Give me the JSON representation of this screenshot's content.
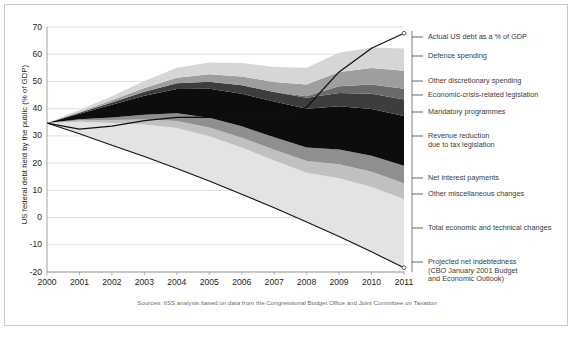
{
  "figure": {
    "source_note": "Sources: IISS analysis based on data from the Congressional Budget Office and Joint Committee on Taxation"
  },
  "chart_data": {
    "type": "area",
    "title": "",
    "xlabel": "",
    "ylabel": "US federal debt held by the public (% of GDP)",
    "xlim": [
      2000,
      2011
    ],
    "ylim": [
      -20,
      70
    ],
    "ytick_labels": [
      "70",
      "60",
      "50",
      "40",
      "30",
      "20",
      "10",
      "0",
      "-10",
      "-20"
    ],
    "ytick_values": [
      70,
      60,
      50,
      40,
      30,
      20,
      10,
      0,
      -10,
      -20
    ],
    "xtick_labels": [
      "2000",
      "2001",
      "2002",
      "2003",
      "2004",
      "2005",
      "2006",
      "2007",
      "2008",
      "2009",
      "2010",
      "2011"
    ],
    "x": [
      2000,
      2001,
      2002,
      2003,
      2004,
      2005,
      2006,
      2007,
      2008,
      2009,
      2010,
      2011
    ],
    "grid": "horizontal",
    "legend_position": "right-outside",
    "baseline_series": {
      "name": "Projected net indebtedness (CBO January 2001 Budget and Economic Outlook)",
      "values": [
        34.7,
        30.8,
        26.6,
        22.4,
        18.0,
        13.4,
        8.6,
        3.6,
        -1.6,
        -7.0,
        -12.6,
        -18.4
      ],
      "color": "#111111"
    },
    "total_line": {
      "name": "Actual US debt as a % of GDP",
      "values": [
        34.7,
        32.5,
        33.6,
        35.6,
        36.8,
        36.9,
        36.5,
        36.2,
        40.5,
        53.5,
        62.2,
        67.7
      ],
      "color": "#111111"
    },
    "series": [
      {
        "name": "Total economic and technical changes",
        "values": [
          0.0,
          4.4,
          8.1,
          11.8,
          14.9,
          16.5,
          17.1,
          17.4,
          18.1,
          21.4,
          23.8,
          25.2
        ],
        "color": "#e3e3e3"
      },
      {
        "name": "Other miscellaneous changes",
        "values": [
          0.0,
          0.5,
          1.1,
          1.8,
          2.6,
          3.2,
          3.6,
          3.9,
          4.3,
          5.2,
          5.6,
          5.8
        ],
        "color": "#c0c0c0"
      },
      {
        "name": "Net interest payments",
        "values": [
          0.0,
          0.4,
          1.0,
          1.8,
          2.8,
          3.6,
          4.2,
          4.6,
          4.9,
          5.4,
          5.9,
          6.4
        ],
        "color": "#8f8f8f"
      },
      {
        "name": "Revenue reduction due to tax legislation",
        "values": [
          0.0,
          2.0,
          4.6,
          6.9,
          8.9,
          10.6,
          12.0,
          13.1,
          14.3,
          15.9,
          17.2,
          18.3
        ],
        "color": "#0d0d0d"
      },
      {
        "name": "Mandatory programmes",
        "values": [
          0.0,
          0.4,
          0.9,
          1.5,
          2.1,
          2.6,
          3.1,
          3.5,
          4.0,
          4.9,
          5.6,
          6.1
        ],
        "color": "#3d3d3d"
      },
      {
        "name": "Economic-crisis-related legislation",
        "values": [
          0.0,
          0.0,
          0.0,
          0.0,
          0.0,
          0.0,
          0.0,
          0.0,
          0.6,
          2.4,
          3.4,
          3.9
        ],
        "color": "#6a6a6a"
      },
      {
        "name": "Other discretionary spending",
        "values": [
          0.0,
          0.3,
          0.8,
          1.4,
          2.1,
          2.7,
          3.2,
          3.7,
          4.3,
          5.3,
          6.0,
          6.6
        ],
        "color": "#9e9e9e"
      },
      {
        "name": "Defence spending",
        "values": [
          0.0,
          0.7,
          1.5,
          2.6,
          3.6,
          4.4,
          5.0,
          5.5,
          6.1,
          7.0,
          7.6,
          8.2
        ],
        "color": "#d6d6d6"
      }
    ]
  },
  "legend": [
    {
      "id": "actual-us-debt",
      "label": "Actual US debt as a % of GDP",
      "y": 37,
      "color": "#111111"
    },
    {
      "id": "defence-spending",
      "label": "Defence spending",
      "y": 56,
      "color": "#d6d6d6"
    },
    {
      "id": "other-discretionary-spending",
      "label": "Other discretionary spending",
      "y": 81,
      "color": "#9e9e9e"
    },
    {
      "id": "economic-crisis-related-legislation",
      "label": "Economic-crisis-related legislation",
      "y": 95,
      "color": "#6a6a6a"
    },
    {
      "id": "mandatory-programmes",
      "label": "Mandatory programmes",
      "y": 112,
      "color": "#3d3d3d"
    },
    {
      "id": "revenue-reduction",
      "label": "Revenue reduction\ndue to tax legislation",
      "y": 136,
      "color": "#0d0d0d"
    },
    {
      "id": "net-interest-payments",
      "label": "Net interest payments",
      "y": 178,
      "color": "#8f8f8f"
    },
    {
      "id": "other-miscellaneous-changes",
      "label": "Other miscellaneous changes",
      "y": 194,
      "color": "#c0c0c0"
    },
    {
      "id": "total-economic-and-technical-changes",
      "label": "Total economic and technical changes",
      "y": 228,
      "color": "#e3e3e3"
    },
    {
      "id": "projected-net-indebtedness",
      "label": "Projected net indebtedness\n(CBO January 2001 Budget\nand Economic Outlook)",
      "y": 262,
      "color": "#111111"
    }
  ]
}
